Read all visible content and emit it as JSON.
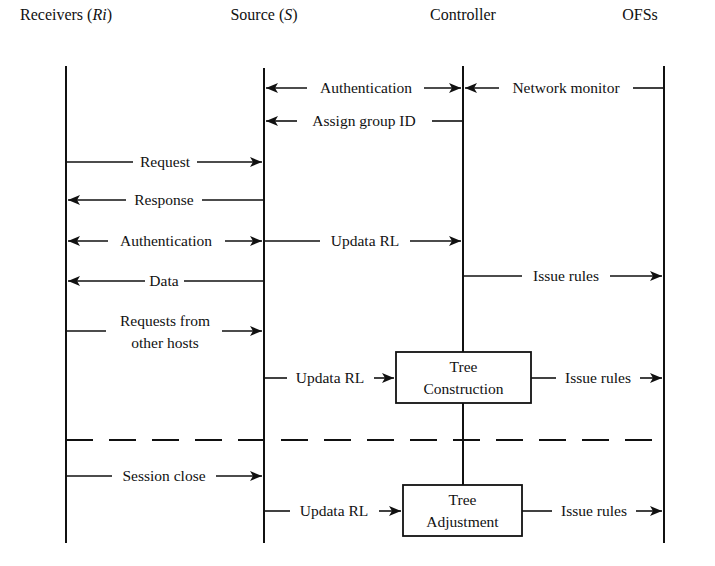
{
  "diagram": {
    "type": "sequence",
    "participants": [
      {
        "id": "R",
        "label": "Receivers (",
        "italic": "Ri",
        "suffix": ")",
        "x": 66
      },
      {
        "id": "S",
        "label": "Source (",
        "italic": "S",
        "suffix": ")",
        "x": 264
      },
      {
        "id": "C",
        "label": "Controller",
        "italic": "",
        "suffix": "",
        "x": 463
      },
      {
        "id": "O",
        "label": "OFSs",
        "italic": "",
        "suffix": "",
        "x": 664
      }
    ],
    "messages": [
      {
        "from": "S",
        "to": "C",
        "label": "Authentication",
        "bidirectional": true,
        "y": 88
      },
      {
        "from": "O",
        "to": "C",
        "label": "Network monitor",
        "bidirectional": false,
        "y": 88
      },
      {
        "from": "C",
        "to": "S",
        "label": "Assign group ID",
        "bidirectional": false,
        "y": 121
      },
      {
        "from": "R",
        "to": "S",
        "label": "Request",
        "bidirectional": false,
        "y": 162
      },
      {
        "from": "S",
        "to": "R",
        "label": "Response",
        "bidirectional": false,
        "y": 200
      },
      {
        "from": "R",
        "to": "S",
        "label": "Authentication",
        "bidirectional": true,
        "y": 241
      },
      {
        "from": "S",
        "to": "C",
        "label": "Updata RL",
        "bidirectional": false,
        "y": 241
      },
      {
        "from": "S",
        "to": "R",
        "label": "Data",
        "bidirectional": false,
        "y": 281
      },
      {
        "from": "C",
        "to": "O",
        "label": "Issue rules",
        "bidirectional": false,
        "y": 276
      },
      {
        "from": "R",
        "to": "S",
        "label": "Requests from other hosts",
        "label_lines": [
          "Requests from",
          "other hosts"
        ],
        "bidirectional": false,
        "y": 331
      },
      {
        "from": "S",
        "to": "C",
        "label": "Updata RL",
        "bidirectional": false,
        "y": 378,
        "target_box": "tree_construction"
      },
      {
        "from": "C",
        "to": "O",
        "label": "Issue rules",
        "bidirectional": false,
        "y": 378,
        "source_box": "tree_construction"
      },
      {
        "from": "R",
        "to": "S",
        "label": "Session close",
        "bidirectional": false,
        "y": 476
      },
      {
        "from": "S",
        "to": "C",
        "label": "Updata RL",
        "bidirectional": false,
        "y": 511,
        "target_box": "tree_adjustment"
      },
      {
        "from": "C",
        "to": "O",
        "label": "Issue rules",
        "bidirectional": false,
        "y": 511,
        "source_box": "tree_adjustment"
      }
    ],
    "boxes": {
      "tree_construction": {
        "lines": [
          "Tree",
          "Construction"
        ]
      },
      "tree_adjustment": {
        "lines": [
          "Tree",
          "Adjustment"
        ]
      }
    },
    "separator": {
      "style": "dashed",
      "y": 440
    }
  },
  "labels": {
    "hdr_receivers": "Receivers (",
    "hdr_receivers_italic": "Ri",
    "hdr_close": ")",
    "hdr_source": "Source (",
    "hdr_source_italic": "S",
    "hdr_controller": "Controller",
    "hdr_ofss": "OFSs",
    "m1": "Authentication",
    "m2": "Network monitor",
    "m3": "Assign group ID",
    "m4": "Request",
    "m5": "Response",
    "m6": "Authentication",
    "m7": "Updata RL",
    "m8": "Data",
    "m9": "Issue rules",
    "m10a": "Requests from",
    "m10b": "other hosts",
    "m11": "Updata RL",
    "m12": "Issue rules",
    "m13": "Session close",
    "m14": "Updata RL",
    "m15": "Issue rules",
    "box1a": "Tree",
    "box1b": "Construction",
    "box2a": "Tree",
    "box2b": "Adjustment"
  },
  "colors": {
    "ink": "#111111",
    "background": "#ffffff"
  }
}
